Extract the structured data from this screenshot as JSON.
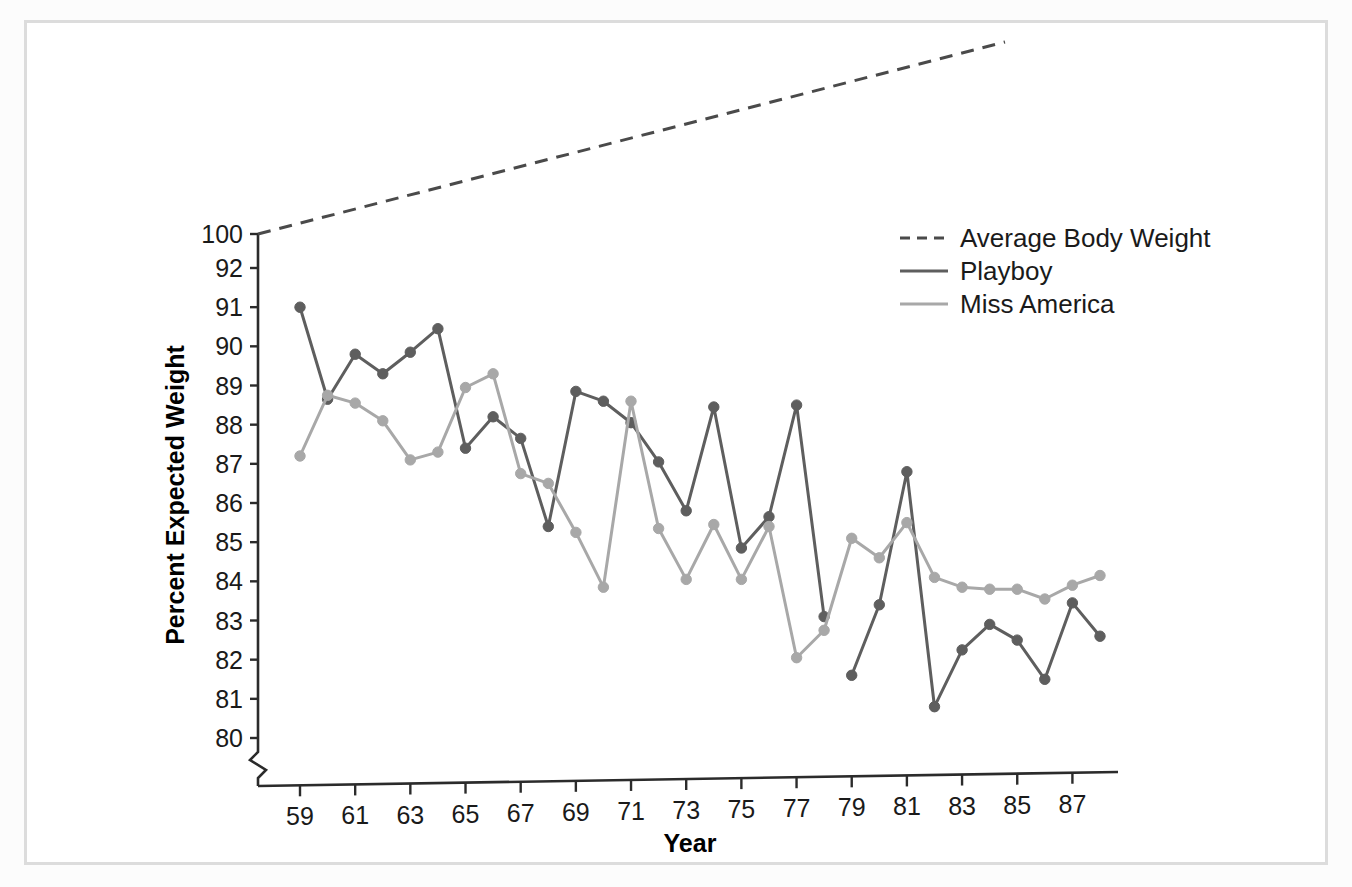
{
  "figure": {
    "background_color": "#ffffff",
    "frame_color": "#dcdcdc"
  },
  "chart_data": {
    "type": "line",
    "title": "",
    "xlabel": "Year",
    "ylabel": "Percent Expected Weight",
    "x": [
      59,
      60,
      61,
      62,
      63,
      64,
      65,
      66,
      67,
      68,
      69,
      70,
      71,
      72,
      73,
      74,
      75,
      76,
      77,
      78,
      79,
      80,
      81,
      82,
      83,
      84,
      85,
      86,
      87,
      88
    ],
    "xtick_labels": [
      "59",
      "61",
      "63",
      "65",
      "67",
      "69",
      "71",
      "73",
      "75",
      "77",
      "79",
      "81",
      "83",
      "85",
      "87"
    ],
    "xtick_values": [
      59,
      61,
      63,
      65,
      67,
      69,
      71,
      73,
      75,
      77,
      79,
      81,
      83,
      85,
      87
    ],
    "ytick_labels": [
      "100",
      "92",
      "91",
      "90",
      "89",
      "88",
      "87",
      "86",
      "85",
      "84",
      "83",
      "82",
      "81",
      "80"
    ],
    "ytick_values": [
      100,
      92,
      91,
      90,
      89,
      88,
      87,
      86,
      85,
      84,
      83,
      82,
      81,
      80
    ],
    "ylim": [
      80,
      92
    ],
    "axis_break": true,
    "axis_break_note": "y-axis broken between 92 and 100; x-axis origin broken",
    "grid": false,
    "legend_position": "upper right",
    "series": [
      {
        "name": "Average Body Weight",
        "style": "dashed",
        "color": "#4a4a4a",
        "markers": false,
        "x": [
          59,
          88
        ],
        "values": [
          100,
          107.5
        ],
        "note": "straight rising dashed trend line drawn above the 100 level"
      },
      {
        "name": "Playboy",
        "style": "solid",
        "color": "#5e5e5e",
        "markers": true,
        "x": [
          59,
          60,
          61,
          62,
          63,
          64,
          65,
          66,
          67,
          68,
          69,
          70,
          71,
          72,
          73,
          74,
          75,
          76,
          77,
          78,
          79,
          80,
          81,
          82,
          83,
          84,
          85,
          86,
          87,
          88
        ],
        "values": [
          91.0,
          88.65,
          89.8,
          89.3,
          89.85,
          90.45,
          87.4,
          88.2,
          87.65,
          85.4,
          88.85,
          88.6,
          88.05,
          87.05,
          85.8,
          88.45,
          84.85,
          85.65,
          88.5,
          83.1,
          81.6,
          83.4,
          86.8,
          80.8,
          82.25,
          82.9,
          82.5,
          81.5,
          83.45,
          82.6
        ],
        "gap_after": 78
      },
      {
        "name": "Miss America",
        "style": "solid",
        "color": "#a8a8a8",
        "markers": true,
        "x": [
          59,
          60,
          61,
          62,
          63,
          64,
          65,
          66,
          67,
          68,
          69,
          70,
          71,
          72,
          73,
          74,
          75,
          76,
          77,
          78,
          79,
          80,
          81,
          82,
          83,
          84,
          85,
          86,
          87,
          88
        ],
        "values": [
          87.2,
          88.75,
          88.55,
          88.1,
          87.1,
          87.3,
          88.95,
          89.3,
          86.75,
          86.5,
          85.25,
          83.85,
          88.6,
          85.35,
          84.05,
          85.45,
          84.05,
          85.4,
          82.05,
          82.75,
          85.1,
          84.6,
          85.5,
          84.1,
          83.85,
          83.8,
          83.8,
          83.55,
          83.9,
          84.15
        ]
      }
    ]
  },
  "legend": {
    "items": [
      {
        "label": "Average Body Weight",
        "swatch": "dashed-line",
        "color": "#4a4a4a"
      },
      {
        "label": "Playboy",
        "swatch": "solid-line",
        "color": "#5e5e5e"
      },
      {
        "label": "Miss America",
        "swatch": "solid-line",
        "color": "#a8a8a8"
      }
    ]
  },
  "axes": {
    "x_title": "Year",
    "y_title": "Percent Expected Weight"
  }
}
